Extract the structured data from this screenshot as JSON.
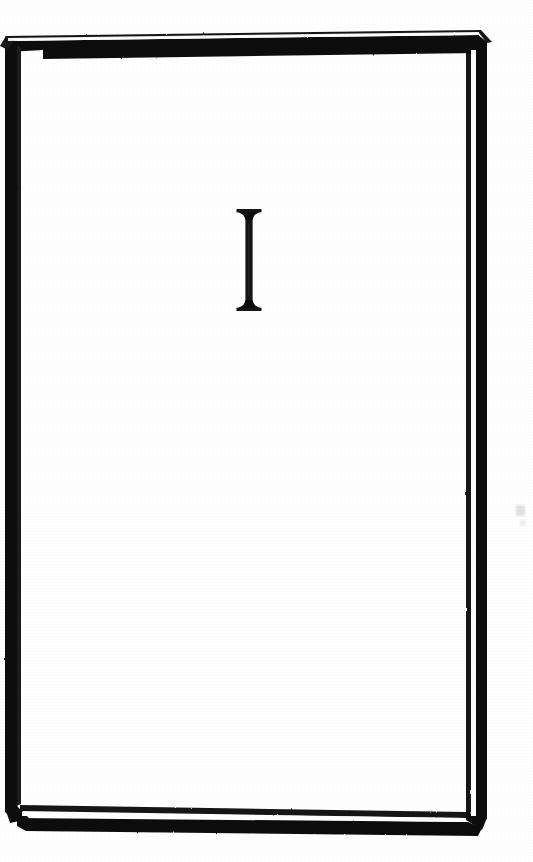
{
  "page": {
    "kind": "scanned-book-page",
    "title": "Chapter opening plate",
    "width": 533,
    "height": 862,
    "background_color": "#ffffff",
    "ink_color": "#111111"
  },
  "frame": {
    "name": "decorative-border-frame",
    "description": "Rectangular plate drawn in perspective with a bevelled three-dimensional edge; thick black band on the left and top, a thin rule plus white gap along the right and bottom, mitred corners.",
    "style": "beveled-3d-slab",
    "stroke_color": "#121212",
    "highlight_color": "#ffffff",
    "bounds": {
      "left": 5,
      "top": 32,
      "right": 487,
      "bottom": 833
    }
  },
  "initial": {
    "name": "drop-cap-initial",
    "letter": "I",
    "style": "flared-slab-serif",
    "description": "Ornamental roman capital I with concave bracketed serifs flaring at head and foot.",
    "color": "#141414",
    "bounds": {
      "left": 237,
      "top": 209,
      "right": 263,
      "bottom": 309
    }
  },
  "artifacts": {
    "smudge_label": "scan smudge",
    "smudge_color": "#c9c9c9"
  }
}
